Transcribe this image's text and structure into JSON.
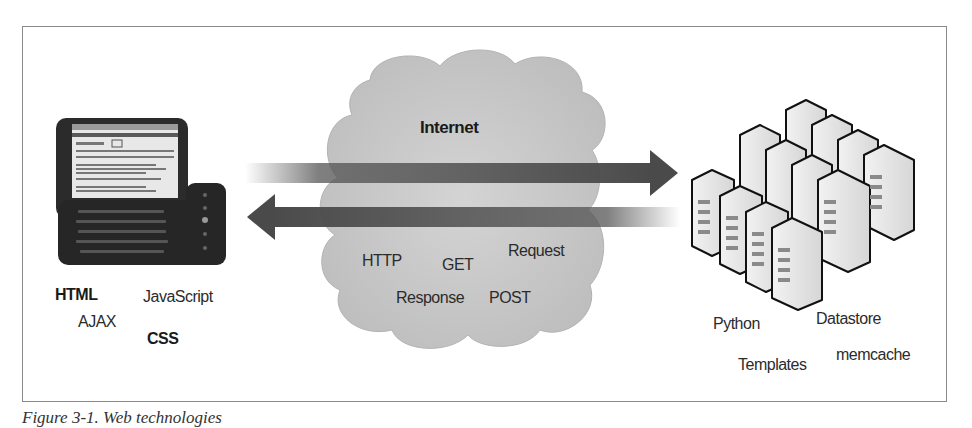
{
  "figure": {
    "caption": "Figure 3-1. Web technologies"
  },
  "client": {
    "device": "phone-icon",
    "labels": [
      {
        "text": "HTML",
        "bold": true
      },
      {
        "text": "JavaScript",
        "bold": false
      },
      {
        "text": "AJAX",
        "bold": false
      },
      {
        "text": "CSS",
        "bold": true
      }
    ]
  },
  "network": {
    "title": "Internet",
    "labels": [
      {
        "text": "HTTP"
      },
      {
        "text": "GET"
      },
      {
        "text": "Request"
      },
      {
        "text": "Response"
      },
      {
        "text": "POST"
      }
    ],
    "arrows": [
      {
        "direction": "right",
        "name": "request-arrow"
      },
      {
        "direction": "left",
        "name": "response-arrow"
      }
    ]
  },
  "server": {
    "device": "server-cluster-icon",
    "labels": [
      {
        "text": "Python"
      },
      {
        "text": "Datastore"
      },
      {
        "text": "Templates"
      },
      {
        "text": "memcache"
      }
    ]
  },
  "colors": {
    "frame_border": "#8a8a8a",
    "cloud_fill": "#c9c9c9",
    "arrow_fill": "#555555",
    "server_fill": "#e6e6e6",
    "phone_body": "#2a2a2a"
  }
}
